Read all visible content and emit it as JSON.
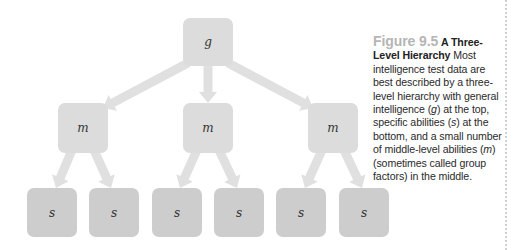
{
  "figure": {
    "number": "Figure 9.5",
    "title": "A Three-Level Hierarchy",
    "caption_parts": [
      {
        "text": "Most intelligence test data are best described by a three-level hierarchy with general intelligence (",
        "italic": false
      },
      {
        "text": "g",
        "italic": true
      },
      {
        "text": ") at the top, specific abilities (",
        "italic": false
      },
      {
        "text": "s",
        "italic": true
      },
      {
        "text": ") at the bottom, and a small number of middle-level abilities (",
        "italic": false
      },
      {
        "text": "m",
        "italic": true
      },
      {
        "text": ") (sometimes called group factors) in the middle.",
        "italic": false
      }
    ]
  },
  "colors": {
    "top_box": "#dcdcdc",
    "middle_box": "#dcdcdc",
    "bottom_box": "#cdcdcd",
    "arrow": "#e0e0e0",
    "border_dots": "#d0d0d0"
  },
  "hierarchy": {
    "top": {
      "label": "g",
      "x": 183,
      "y": 18,
      "w": 50,
      "h": 48
    },
    "middle": [
      {
        "label": "m",
        "x": 58,
        "y": 103,
        "w": 50,
        "h": 50
      },
      {
        "label": "m",
        "x": 183,
        "y": 103,
        "w": 50,
        "h": 50
      },
      {
        "label": "m",
        "x": 308,
        "y": 103,
        "w": 50,
        "h": 50
      }
    ],
    "bottom": [
      {
        "label": "s",
        "x": 27,
        "y": 188,
        "w": 50,
        "h": 49
      },
      {
        "label": "s",
        "x": 89,
        "y": 188,
        "w": 50,
        "h": 49
      },
      {
        "label": "s",
        "x": 152,
        "y": 188,
        "w": 50,
        "h": 49
      },
      {
        "label": "s",
        "x": 214,
        "y": 188,
        "w": 50,
        "h": 49
      },
      {
        "label": "s",
        "x": 276,
        "y": 188,
        "w": 50,
        "h": 49
      },
      {
        "label": "s",
        "x": 339,
        "y": 188,
        "w": 50,
        "h": 49
      }
    ]
  },
  "arrows": [
    {
      "from": [
        188,
        63
      ],
      "to": [
        103,
        108
      ]
    },
    {
      "from": [
        208,
        66
      ],
      "to": [
        208,
        103
      ]
    },
    {
      "from": [
        228,
        63
      ],
      "to": [
        313,
        108
      ]
    },
    {
      "from": [
        72,
        150
      ],
      "to": [
        56,
        188
      ]
    },
    {
      "from": [
        94,
        150
      ],
      "to": [
        111,
        188
      ]
    },
    {
      "from": [
        197,
        150
      ],
      "to": [
        180,
        188
      ]
    },
    {
      "from": [
        219,
        150
      ],
      "to": [
        237,
        188
      ]
    },
    {
      "from": [
        322,
        150
      ],
      "to": [
        305,
        188
      ]
    },
    {
      "from": [
        344,
        150
      ],
      "to": [
        362,
        188
      ]
    }
  ]
}
